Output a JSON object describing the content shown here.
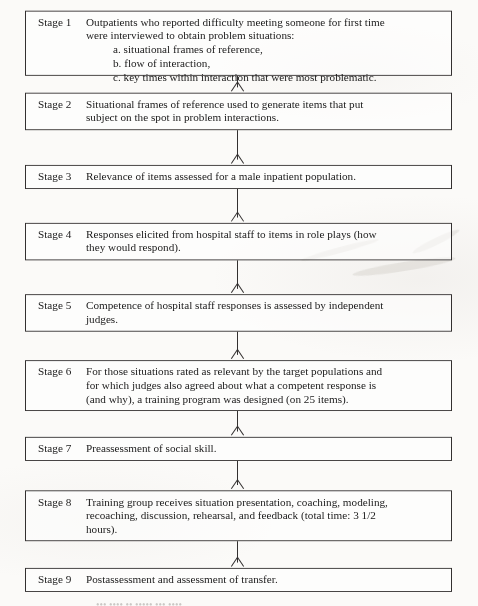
{
  "document": {
    "type": "flowchart",
    "medium": "scanned book page",
    "orientation": "vertical top-to-bottom",
    "node_count": 9,
    "connector_count": 8,
    "connector_style": "vertical line with open V arrowhead",
    "border_color": "#333030",
    "paper_color": "#fbfaf8",
    "text_color": "#1a1a1a"
  },
  "nodes": [
    {
      "id": "stage-1",
      "label": "Stage 1",
      "lines": [
        "Outpatients who reported difficulty meeting someone for first time",
        "were interviewed to obtain problem situations:"
      ],
      "sub_items": [
        "a.  situational frames of reference,",
        "b.  flow of interaction,",
        "c.  key times within interaction that were most problematic."
      ]
    },
    {
      "id": "stage-2",
      "label": "Stage 2",
      "lines": [
        "Situational frames of reference used to generate items that put",
        "subject on the spot in problem interactions."
      ],
      "sub_items": []
    },
    {
      "id": "stage-3",
      "label": "Stage 3",
      "lines": [
        "Relevance of items assessed for a male inpatient population."
      ],
      "sub_items": []
    },
    {
      "id": "stage-4",
      "label": "Stage 4",
      "lines": [
        "Responses elicited from hospital staff to items in role plays (how",
        "they would respond)."
      ],
      "sub_items": []
    },
    {
      "id": "stage-5",
      "label": "Stage 5",
      "lines": [
        "Competence of hospital staff responses is assessed by independent",
        "judges."
      ],
      "sub_items": []
    },
    {
      "id": "stage-6",
      "label": "Stage 6",
      "lines": [
        "For those situations rated as relevant by the target populations and",
        "for which judges also agreed about what a competent response is",
        "(and why), a training program was designed (on 25 items)."
      ],
      "sub_items": []
    },
    {
      "id": "stage-7",
      "label": "Stage 7",
      "lines": [
        "Preassessment of social skill."
      ],
      "sub_items": []
    },
    {
      "id": "stage-8",
      "label": "Stage 8",
      "lines": [
        "Training group receives situation presentation, coaching, modeling,",
        "recoaching, discussion, rehearsal, and feedback (total time: 3 1/2",
        "hours)."
      ],
      "sub_items": []
    },
    {
      "id": "stage-9",
      "label": "Stage 9",
      "lines": [
        "Postassessment and assessment of transfer."
      ],
      "sub_items": []
    }
  ],
  "caption": {
    "visible": false,
    "note": "cropped at image bottom edge, illegible"
  }
}
